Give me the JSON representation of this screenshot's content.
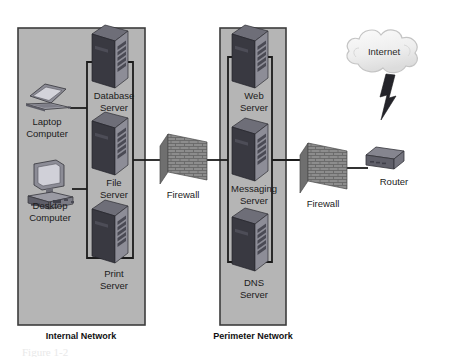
{
  "diagram": {
    "caption": "Figure 1-2",
    "zones": [
      {
        "id": "internal",
        "label": "Internal Network",
        "fill": "#b5b5b5",
        "stroke": "#3c3c3c"
      },
      {
        "id": "perimeter",
        "label": "Perimeter Network",
        "fill": "#b5b5b5",
        "stroke": "#3c3c3c"
      }
    ],
    "nodes": [
      {
        "id": "laptop",
        "type": "laptop-computer",
        "label_line1": "Laptop",
        "label_line2": "Computer",
        "zone": "internal"
      },
      {
        "id": "desktop",
        "type": "desktop-computer",
        "label_line1": "Desktop",
        "label_line2": "Computer",
        "zone": "internal"
      },
      {
        "id": "database-server",
        "type": "server-tower",
        "label_line1": "Database",
        "label_line2": "Server",
        "zone": "internal"
      },
      {
        "id": "file-server",
        "type": "server-tower",
        "label_line1": "File",
        "label_line2": "Server",
        "zone": "internal"
      },
      {
        "id": "print-server",
        "type": "server-tower",
        "label_line1": "Print",
        "label_line2": "Server",
        "zone": "internal"
      },
      {
        "id": "web-server",
        "type": "server-tower",
        "label_line1": "Web",
        "label_line2": "Server",
        "zone": "perimeter"
      },
      {
        "id": "messaging-server",
        "type": "server-tower",
        "label_line1": "Messaging",
        "label_line2": "Server",
        "zone": "perimeter"
      },
      {
        "id": "dns-server",
        "type": "server-tower",
        "label_line1": "DNS",
        "label_line2": "Server",
        "zone": "perimeter"
      },
      {
        "id": "firewall-inner",
        "type": "firewall-brick-wall",
        "label_line1": "Firewall",
        "label_line2": "",
        "zone": "none"
      },
      {
        "id": "firewall-outer",
        "type": "firewall-brick-wall",
        "label_line1": "Firewall",
        "label_line2": "",
        "zone": "none"
      },
      {
        "id": "router",
        "type": "router-box",
        "label_line1": "Router",
        "label_line2": "",
        "zone": "none"
      },
      {
        "id": "internet",
        "type": "cloud",
        "label_line1": "Internet",
        "label_line2": "",
        "zone": "none"
      }
    ],
    "colors": {
      "zone_fill": "#b5b5b5",
      "zone_stroke": "#3c3c3c",
      "server_dark": "#3a3a42",
      "server_mid": "#5a5a64",
      "server_light": "#8e8e98",
      "server_top": "#6e6e78",
      "brick_face": "#8a8a8a",
      "brick_line": "#5d5d5d",
      "brick_edge": "#6a6a6a",
      "cloud_fill": "#f2f2f2",
      "cloud_stroke": "#c8c8c8",
      "link_line": "#1c1c1c",
      "device_body": "#6f6f79",
      "device_screen": "#b9b9c2",
      "text": "#1b1b1b"
    }
  }
}
